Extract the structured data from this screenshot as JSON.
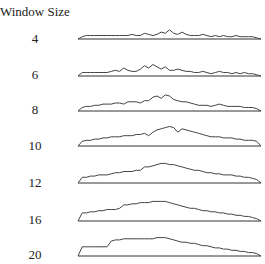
{
  "chart_data": {
    "type": "line",
    "title": "Window Size",
    "xlabel": "",
    "ylabel": "",
    "layout": "small multiples stacked vertically, one sparkline per window size, no axes ticks, baseline line under each",
    "grid": false,
    "series": [
      {
        "name": "4",
        "values": [
          0,
          2,
          3,
          3,
          3,
          3,
          3,
          3,
          3,
          3,
          3,
          3,
          3,
          4,
          3,
          3,
          5,
          4,
          3,
          4,
          6,
          5,
          8,
          5,
          4,
          6,
          4,
          3,
          3,
          3,
          4,
          3,
          2,
          3,
          2,
          3,
          2,
          2,
          3,
          2,
          2,
          2,
          2,
          1,
          0
        ]
      },
      {
        "name": "6",
        "values": [
          0,
          3,
          3,
          3,
          3,
          3,
          3,
          3,
          4,
          5,
          4,
          7,
          5,
          4,
          4,
          6,
          9,
          7,
          10,
          8,
          6,
          8,
          5,
          5,
          6,
          5,
          4,
          4,
          3,
          3,
          4,
          3,
          2,
          3,
          4,
          3,
          3,
          2,
          3,
          2,
          3,
          2,
          2,
          1,
          0
        ]
      },
      {
        "name": "8",
        "values": [
          0,
          3,
          4,
          4,
          5,
          5,
          6,
          6,
          6,
          7,
          7,
          6,
          8,
          8,
          8,
          7,
          9,
          9,
          12,
          13,
          11,
          14,
          13,
          10,
          9,
          8,
          8,
          7,
          6,
          5,
          5,
          5,
          4,
          5,
          6,
          5,
          4,
          4,
          4,
          4,
          3,
          3,
          3,
          2,
          0
        ]
      },
      {
        "name": "10",
        "values": [
          0,
          4,
          5,
          5,
          6,
          6,
          7,
          7,
          8,
          8,
          8,
          9,
          9,
          9,
          10,
          10,
          11,
          9,
          12,
          14,
          15,
          16,
          17,
          16,
          12,
          15,
          14,
          13,
          12,
          11,
          10,
          9,
          8,
          8,
          8,
          7,
          7,
          7,
          6,
          6,
          5,
          5,
          5,
          4,
          0
        ]
      },
      {
        "name": "12",
        "values": [
          0,
          5,
          5,
          6,
          6,
          7,
          7,
          7,
          8,
          9,
          9,
          10,
          10,
          10,
          11,
          11,
          14,
          14,
          15,
          16,
          17,
          17,
          16,
          16,
          15,
          14,
          13,
          12,
          11,
          11,
          10,
          9,
          9,
          8,
          8,
          7,
          7,
          7,
          6,
          6,
          5,
          5,
          4,
          3,
          0
        ]
      },
      {
        "name": "16",
        "values": [
          0,
          7,
          7,
          8,
          8,
          9,
          9,
          10,
          10,
          10,
          11,
          14,
          14,
          15,
          15,
          16,
          16,
          16,
          17,
          17,
          17,
          17,
          16,
          15,
          14,
          13,
          12,
          11,
          11,
          10,
          9,
          9,
          8,
          8,
          7,
          7,
          6,
          6,
          5,
          5,
          4,
          4,
          3,
          2,
          0
        ]
      },
      {
        "name": "20",
        "values": [
          0,
          8,
          8,
          8,
          8,
          8,
          8,
          8,
          13,
          14,
          14,
          15,
          15,
          15,
          15,
          15,
          15,
          15,
          15,
          16,
          16,
          16,
          15,
          14,
          13,
          12,
          12,
          11,
          11,
          10,
          9,
          9,
          8,
          7,
          7,
          6,
          6,
          5,
          5,
          4,
          4,
          3,
          3,
          2,
          0
        ]
      }
    ],
    "annotations": []
  },
  "labels": [
    "4",
    "6",
    "8",
    "10",
    "12",
    "16",
    "20"
  ]
}
